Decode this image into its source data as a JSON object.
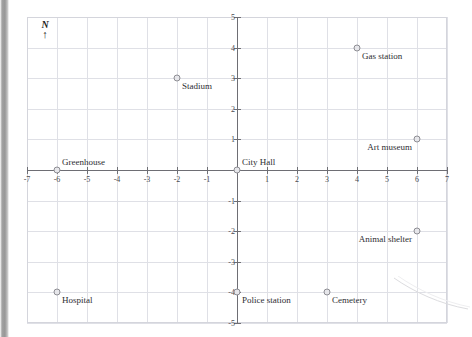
{
  "figure": {
    "north_indicator": {
      "letter": "N",
      "arrow": "↑"
    },
    "grid_color": "#dfe0e6",
    "axis_color": "#6e6e74",
    "marker_fill": "#e6e6ea",
    "marker_stroke": "#8d8d93"
  },
  "chart_data": {
    "type": "scatter",
    "title": "",
    "subtitle": "",
    "xlabel": "",
    "ylabel": "",
    "xlim": [
      -7,
      7
    ],
    "ylim": [
      -5,
      5
    ],
    "grid": true,
    "legend": "none",
    "annotations": [
      "N"
    ],
    "xticks": [
      -7,
      -6,
      -5,
      -4,
      -3,
      -2,
      -1,
      1,
      2,
      3,
      4,
      5,
      6,
      7
    ],
    "yticks": [
      -5,
      -4,
      -3,
      -2,
      -1,
      1,
      2,
      3,
      4,
      5
    ],
    "xtick_labels": [
      "-7",
      "-6",
      "-5",
      "-4",
      "-3",
      "-2",
      "-1",
      "1",
      "2",
      "3",
      "4",
      "5",
      "6",
      "7"
    ],
    "ytick_labels": [
      "-5",
      "-4",
      "-3",
      "-2",
      "-1",
      "1",
      "2",
      "3",
      "4",
      "5"
    ],
    "points": [
      {
        "label": "Stadium",
        "x": -2,
        "y": 3,
        "label_pos": "below-right"
      },
      {
        "label": "Gas station",
        "x": 4,
        "y": 4,
        "label_pos": "below-right"
      },
      {
        "label": "Art museum",
        "x": 6,
        "y": 1,
        "label_pos": "below-left"
      },
      {
        "label": "Greenhouse",
        "x": -6,
        "y": 0,
        "label_pos": "above-right"
      },
      {
        "label": "City Hall",
        "x": 0,
        "y": 0,
        "label_pos": "above-right"
      },
      {
        "label": "Animal shelter",
        "x": 6,
        "y": -2,
        "label_pos": "below-left"
      },
      {
        "label": "Hospital",
        "x": -6,
        "y": -4,
        "label_pos": "below-right"
      },
      {
        "label": "Police station",
        "x": 0,
        "y": -4,
        "label_pos": "below-right"
      },
      {
        "label": "Cemetery",
        "x": 3,
        "y": -4,
        "label_pos": "below-right"
      }
    ]
  }
}
